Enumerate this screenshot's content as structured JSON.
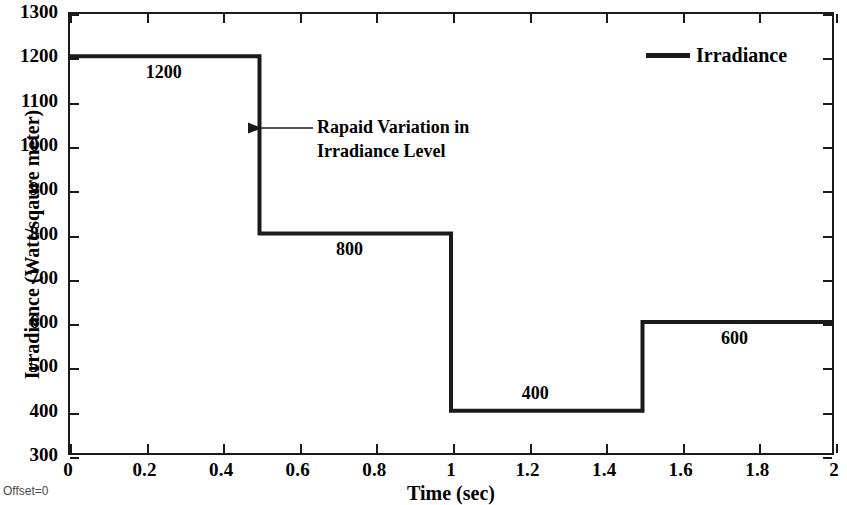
{
  "chart_data": {
    "type": "line",
    "subtype": "step-post",
    "title": "",
    "xlabel": "Time (sec)",
    "ylabel": "Irradiance (Watt/sqaure meter)",
    "xlim": [
      0,
      2
    ],
    "ylim": [
      300,
      1300
    ],
    "xticks": [
      "0",
      "0.2",
      "0.4",
      "0.6",
      "0.8",
      "1",
      "1.2",
      "1.4",
      "1.6",
      "1.8",
      "2"
    ],
    "xtick_values": [
      0,
      0.2,
      0.4,
      0.6,
      0.8,
      1,
      1.2,
      1.4,
      1.6,
      1.8,
      2
    ],
    "yticks": [
      "300",
      "400",
      "500",
      "600",
      "700",
      "800",
      "900",
      "1000",
      "1100",
      "1200",
      "1300"
    ],
    "ytick_values": [
      300,
      400,
      500,
      600,
      700,
      800,
      900,
      1000,
      1100,
      1200,
      1300
    ],
    "grid": false,
    "legend_position": "top-right",
    "series": [
      {
        "name": "Irradiance",
        "color": "#1a1a1a",
        "linewidth": 4,
        "x": [
          0,
          0.5,
          0.5,
          1.0,
          1.0,
          1.5,
          1.5,
          2.0
        ],
        "y": [
          1200,
          1200,
          800,
          800,
          400,
          400,
          600,
          600
        ],
        "steps": [
          {
            "x_start": 0,
            "x_end": 0.5,
            "value": 1200
          },
          {
            "x_start": 0.5,
            "x_end": 1.0,
            "value": 800
          },
          {
            "x_start": 1.0,
            "x_end": 1.5,
            "value": 400
          },
          {
            "x_start": 1.5,
            "x_end": 2.0,
            "value": 600
          }
        ]
      }
    ],
    "point_labels": [
      {
        "text": "1200",
        "x": 0.25,
        "y": 1162,
        "placement": "below-line"
      },
      {
        "text": "800",
        "x": 0.735,
        "y": 762,
        "placement": "below-line"
      },
      {
        "text": "400",
        "x": 1.22,
        "y": 438,
        "placement": "above-line"
      },
      {
        "text": "600",
        "x": 1.74,
        "y": 562,
        "placement": "below-line"
      }
    ],
    "annotations": [
      {
        "name": "rapid-variation-annotation",
        "text_line_1": "Rapaid Variation in",
        "text_line_2": "Irradiance Level",
        "arrow_from_x": 0.64,
        "arrow_to_x": 0.505,
        "arrow_y": 1038
      }
    ]
  },
  "legend": {
    "entries": [
      {
        "label": "Irradiance",
        "color": "#1a1a1a"
      }
    ]
  },
  "footnote": {
    "offset_label": "Offset=0"
  },
  "colors": {
    "axis": "#1a1a1a",
    "series": "#1a1a1a",
    "background": "#ffffff",
    "text": "#000000",
    "footnote": "#4a4a4a"
  }
}
